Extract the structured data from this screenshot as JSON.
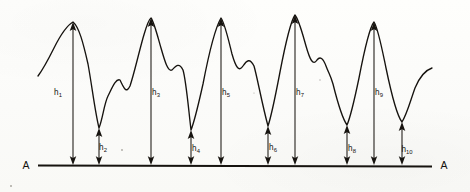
{
  "figure": {
    "kind": "line-profile-diagram",
    "baseline": {
      "left_label": "A",
      "right_label": "A",
      "label_name": "reference-line-a",
      "y": 165,
      "x_start": 38,
      "x_end": 432
    },
    "colors": {
      "ink": "#16130f",
      "paper": "#fcfcfa",
      "shaft": "#1b1713"
    },
    "measurements": [
      {
        "label": "h",
        "sub": "1",
        "id": "h1",
        "kind": "peak",
        "x": 73,
        "tip_y": 22,
        "base_y": 165,
        "label_x": 58,
        "label_y": 95,
        "height_px": 143
      },
      {
        "label": "h",
        "sub": "2",
        "id": "h2",
        "kind": "valley",
        "x": 99,
        "tip_y": 128,
        "base_y": 165,
        "label_x": 103,
        "label_y": 150,
        "height_px": 37
      },
      {
        "label": "h",
        "sub": "3",
        "id": "h3",
        "kind": "peak",
        "x": 151,
        "tip_y": 18,
        "base_y": 165,
        "label_x": 156,
        "label_y": 95,
        "height_px": 147
      },
      {
        "label": "h",
        "sub": "4",
        "id": "h4",
        "kind": "valley",
        "x": 191,
        "tip_y": 130,
        "base_y": 165,
        "label_x": 196,
        "label_y": 151,
        "height_px": 35
      },
      {
        "label": "h",
        "sub": "5",
        "id": "h5",
        "kind": "peak",
        "x": 221,
        "tip_y": 18,
        "base_y": 165,
        "label_x": 226,
        "label_y": 95,
        "height_px": 147
      },
      {
        "label": "h",
        "sub": "6",
        "id": "h6",
        "kind": "valley",
        "x": 268,
        "tip_y": 126,
        "base_y": 165,
        "label_x": 273,
        "label_y": 150,
        "height_px": 39
      },
      {
        "label": "h",
        "sub": "7",
        "id": "h7",
        "kind": "peak",
        "x": 295,
        "tip_y": 15,
        "base_y": 165,
        "label_x": 300,
        "label_y": 95,
        "height_px": 150
      },
      {
        "label": "h",
        "sub": "8",
        "id": "h8",
        "kind": "valley",
        "x": 347,
        "tip_y": 125,
        "base_y": 165,
        "label_x": 352,
        "label_y": 151,
        "height_px": 40
      },
      {
        "label": "h",
        "sub": "9",
        "id": "h9",
        "kind": "peak",
        "x": 374,
        "tip_y": 22,
        "base_y": 165,
        "label_x": 379,
        "label_y": 95,
        "height_px": 143
      },
      {
        "label": "h",
        "sub": "10",
        "id": "h10",
        "kind": "valley",
        "x": 402,
        "tip_y": 122,
        "base_y": 165,
        "label_x": 407,
        "label_y": 152,
        "height_px": 43
      }
    ]
  },
  "chart_data": {
    "type": "line",
    "title": "",
    "xlabel": "",
    "ylabel": "",
    "grid": false,
    "legend_position": "none",
    "reference_line": "A-A",
    "x": [
      38,
      52,
      62,
      73,
      84,
      92,
      99,
      108,
      116,
      124,
      131,
      140,
      151,
      161,
      170,
      178,
      186,
      191,
      200,
      210,
      221,
      231,
      240,
      248,
      257,
      268,
      278,
      287,
      295,
      305,
      315,
      322,
      330,
      339,
      347,
      357,
      366,
      374,
      384,
      393,
      402,
      412,
      424,
      432
    ],
    "y_profile_px": [
      76,
      58,
      40,
      22,
      48,
      86,
      128,
      100,
      80,
      92,
      78,
      52,
      18,
      46,
      72,
      68,
      104,
      130,
      98,
      56,
      18,
      48,
      70,
      62,
      84,
      126,
      82,
      40,
      15,
      44,
      64,
      58,
      72,
      104,
      125,
      88,
      48,
      22,
      52,
      92,
      122,
      96,
      74,
      68
    ],
    "note_axis_inverted": true,
    "peaks": {
      "labels": [
        "h1",
        "h3",
        "h5",
        "h7",
        "h9"
      ],
      "x": [
        73,
        151,
        221,
        295,
        374
      ],
      "height_px": [
        143,
        147,
        147,
        150,
        143
      ]
    },
    "valleys": {
      "labels": [
        "h2",
        "h4",
        "h6",
        "h8",
        "h10"
      ],
      "x": [
        99,
        191,
        268,
        347,
        402
      ],
      "height_px": [
        37,
        35,
        39,
        40,
        43
      ]
    }
  }
}
